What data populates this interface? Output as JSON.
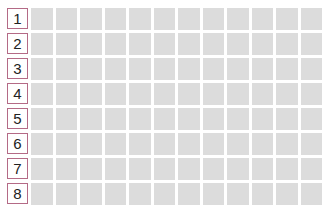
{
  "grid": {
    "rows": [
      {
        "label": "1"
      },
      {
        "label": "2"
      },
      {
        "label": "3"
      },
      {
        "label": "4"
      },
      {
        "label": "5"
      },
      {
        "label": "6"
      },
      {
        "label": "7"
      },
      {
        "label": "8"
      }
    ],
    "columns": 12,
    "colors": {
      "cell": "#dcdcdc",
      "label_border": "#b46a86"
    }
  }
}
